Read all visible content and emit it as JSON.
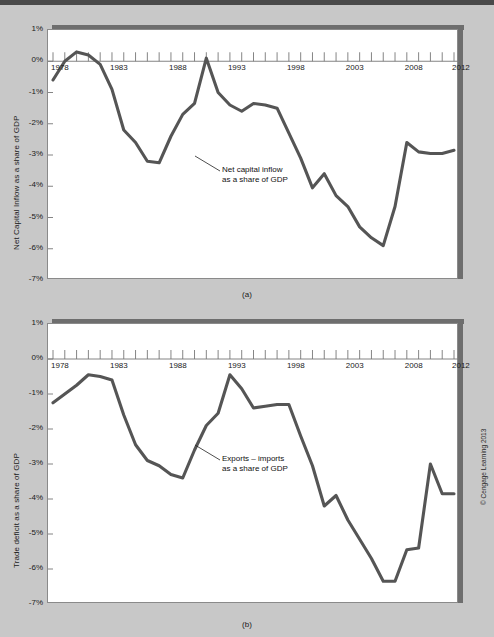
{
  "figure": {
    "background_color": "#c8c8c8",
    "line_color": "#555555",
    "credit": "© Cengage Learning 2013",
    "caption_a": "(a)",
    "caption_b": "(b)"
  },
  "chart_data": [
    {
      "id": "panel-a",
      "type": "line",
      "title": "",
      "xlabel": "",
      "ylabel": "Net Capital Inflow as a share of GDP",
      "annotation": [
        "Net capital inflow",
        "as a share of GDP"
      ],
      "annotation_target_year": 1988,
      "annotation_target_value": -2.35,
      "grid": false,
      "legend": "none",
      "xlim": [
        1978,
        2012
      ],
      "ylim": [
        -7,
        1
      ],
      "ytick_labels": [
        "1%",
        "0%",
        "-1%",
        "-2%",
        "-3%",
        "-4%",
        "-5%",
        "-6%",
        "-7%"
      ],
      "ytick_values": [
        1,
        0,
        -1,
        -2,
        -3,
        -4,
        -5,
        -6,
        -7
      ],
      "xtick_labels": [
        "1978",
        "1983",
        "1988",
        "1993",
        "1998",
        "2003",
        "2008",
        "2012"
      ],
      "xtick_values": [
        1978,
        1983,
        1988,
        1993,
        1998,
        2003,
        2008,
        2012
      ],
      "x": [
        1978,
        1979,
        1980,
        1981,
        1982,
        1983,
        1984,
        1985,
        1986,
        1987,
        1988,
        1989,
        1990,
        1991,
        1992,
        1993,
        1994,
        1995,
        1996,
        1997,
        1998,
        1999,
        2000,
        2001,
        2002,
        2003,
        2004,
        2005,
        2006,
        2007,
        2008,
        2009,
        2010,
        2011,
        2012
      ],
      "values": [
        -0.6,
        0.0,
        0.3,
        0.2,
        -0.1,
        -0.9,
        -2.2,
        -2.6,
        -3.2,
        -3.25,
        -2.4,
        -1.7,
        -1.35,
        0.1,
        -1.0,
        -1.4,
        -1.6,
        -1.35,
        -1.4,
        -1.5,
        -2.3,
        -3.1,
        -4.05,
        -3.6,
        -4.3,
        -4.65,
        -5.3,
        -5.65,
        -5.9,
        -4.65,
        -2.6,
        -2.9,
        -2.95,
        -2.95,
        -2.85
      ]
    },
    {
      "id": "panel-b",
      "type": "line",
      "title": "",
      "xlabel": "",
      "ylabel": "Trade deficit as a share of GDP",
      "annotation": [
        "Exports – imports",
        "as a share of GDP"
      ],
      "annotation_target_year": 1988,
      "annotation_target_value": -2.6,
      "grid": false,
      "legend": "none",
      "xlim": [
        1978,
        2012
      ],
      "ylim": [
        -7,
        1
      ],
      "ytick_labels": [
        "1%",
        "0%",
        "-1%",
        "-2%",
        "-3%",
        "-4%",
        "-5%",
        "-6%",
        "-7%"
      ],
      "ytick_values": [
        1,
        0,
        -1,
        -2,
        -3,
        -4,
        -5,
        -6,
        -7
      ],
      "xtick_labels": [
        "1978",
        "1983",
        "1988",
        "1993",
        "1998",
        "2003",
        "2008",
        "2012"
      ],
      "xtick_values": [
        1978,
        1983,
        1988,
        1993,
        1998,
        2003,
        2008,
        2012
      ],
      "x": [
        1978,
        1979,
        1980,
        1981,
        1982,
        1983,
        1984,
        1985,
        1986,
        1987,
        1988,
        1989,
        1990,
        1991,
        1992,
        1993,
        1994,
        1995,
        1996,
        1997,
        1998,
        1999,
        2000,
        2001,
        2002,
        2003,
        2004,
        2005,
        2006,
        2007,
        2008,
        2009,
        2010,
        2011,
        2012
      ],
      "values": [
        -1.25,
        -1.0,
        -0.75,
        -0.45,
        -0.5,
        -0.6,
        -1.6,
        -2.45,
        -2.9,
        -3.05,
        -3.3,
        -3.4,
        -2.6,
        -1.9,
        -1.55,
        -0.45,
        -0.85,
        -1.4,
        -1.35,
        -1.3,
        -1.3,
        -2.2,
        -3.05,
        -4.2,
        -3.9,
        -4.6,
        -5.15,
        -5.7,
        -6.35,
        -6.35,
        -5.45,
        -5.4,
        -3.0,
        -3.85,
        -3.85
      ]
    }
  ]
}
